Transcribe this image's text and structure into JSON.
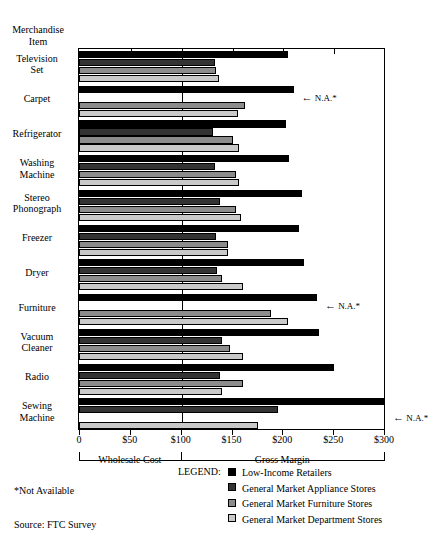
{
  "axis_header": "Merchandise\nItem",
  "header_line1": "Merchandise",
  "header_line2": "Item",
  "notes": {
    "not_available": "*Not Available",
    "source": "Source: FTC Survey"
  },
  "brackets": {
    "left_label": "Wholesale Cost",
    "right_label": "Gross Margin"
  },
  "legend": {
    "title": "LEGEND:",
    "entries": [
      {
        "label": "Low-Income Retailers",
        "color": "#000000"
      },
      {
        "label": "General Market Appliance Stores",
        "color": "#333333"
      },
      {
        "label": "General Market Furniture Stores",
        "color": "#8c8c8c"
      },
      {
        "label": "General Market Department Stores",
        "color": "#c9c9c9"
      }
    ]
  },
  "na_label": "N.A.*",
  "chart_data": {
    "type": "bar",
    "orientation": "horizontal",
    "title": "",
    "xlabel": "",
    "ylabel": "Merchandise Item",
    "xlim": [
      0,
      300
    ],
    "xticks": [
      0,
      50,
      100,
      150,
      200,
      250,
      300
    ],
    "xticklabels": [
      "0",
      "$50",
      "$100",
      "$150",
      "$200",
      "$250",
      "$300"
    ],
    "grid": false,
    "reference_line": 100,
    "legend_position": "bottom",
    "categories": [
      "Television Set",
      "Carpet",
      "Refrigerator",
      "Washing Machine",
      "Stereo Phonograph",
      "Freezer",
      "Dryer",
      "Furniture",
      "Vacuum Cleaner",
      "Radio",
      "Sewing Machine"
    ],
    "category_lines": [
      [
        "Television",
        "Set"
      ],
      [
        "Carpet"
      ],
      [
        "Refrigerator"
      ],
      [
        "Washing",
        "Machine"
      ],
      [
        "Stereo",
        "Phonograph"
      ],
      [
        "Freezer"
      ],
      [
        "Dryer"
      ],
      [
        "Furniture"
      ],
      [
        "Vacuum",
        "Cleaner"
      ],
      [
        "Radio"
      ],
      [
        "Sewing",
        "Machine"
      ]
    ],
    "series": [
      {
        "name": "Low-Income Retailers",
        "color": "#000000",
        "values": [
          205,
          210,
          203,
          206,
          218,
          215,
          220,
          233,
          235,
          250,
          300
        ]
      },
      {
        "name": "General Market Appliance Stores",
        "color": "#333333",
        "values": [
          133,
          null,
          131,
          133,
          138,
          134,
          135,
          null,
          140,
          138,
          195
        ]
      },
      {
        "name": "General Market Furniture Stores",
        "color": "#8c8c8c",
        "values": [
          134,
          162,
          150,
          153,
          153,
          146,
          140,
          188,
          148,
          160,
          null
        ]
      },
      {
        "name": "General Market Department Stores",
        "color": "#c9c9c9",
        "values": [
          137,
          155,
          156,
          156,
          158,
          146,
          160,
          205,
          160,
          140,
          175
        ]
      }
    ],
    "na_markers": [
      {
        "category": "Carpet",
        "series": "General Market Appliance Stores"
      },
      {
        "category": "Freezer",
        "series": "General Market Appliance Stores"
      },
      {
        "category": "Furniture",
        "series": "General Market Appliance Stores"
      },
      {
        "category": "Sewing Machine",
        "series": "General Market Furniture Stores"
      }
    ]
  }
}
